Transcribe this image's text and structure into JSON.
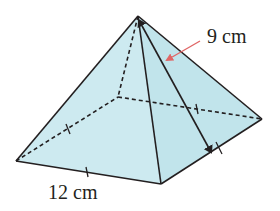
{
  "figure": {
    "type": "square-pyramid",
    "fill_color": "#cdeaf0",
    "right_face_color": "#bfe3ea",
    "edge_color": "#231f20",
    "arrow_color": "#e06666",
    "vertices": {
      "apex": [
        138,
        16
      ],
      "front_left": [
        16,
        161
      ],
      "front_bottom": [
        161,
        184
      ],
      "right": [
        262,
        119
      ],
      "back": [
        118,
        97
      ]
    },
    "labels": {
      "slant_height": "9 cm",
      "base_edge": "12 cm"
    }
  }
}
